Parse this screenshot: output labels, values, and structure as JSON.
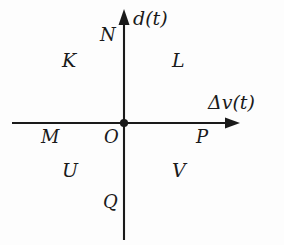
{
  "diagram": {
    "background_color": "#fdfdfd",
    "stroke_color": "#1a1a1a",
    "axes": {
      "vertical": {
        "name": "vertical-axis",
        "label": "d(t)",
        "arrow_direction": "up"
      },
      "horizontal": {
        "name": "horizontal-axis",
        "label": "Δv(t)",
        "arrow_direction": "right"
      }
    },
    "origin": {
      "label": "O",
      "marker": "filled-dot",
      "x": 124,
      "y": 123
    },
    "axis_points": [
      {
        "label": "N",
        "axis": "vertical",
        "side": "upper-left-of-axis"
      },
      {
        "label": "M",
        "axis": "horizontal",
        "side": "left-below-axis"
      },
      {
        "label": "P",
        "axis": "horizontal",
        "side": "right-below-axis"
      },
      {
        "label": "Q",
        "axis": "vertical",
        "side": "lower-left-of-axis"
      }
    ],
    "quadrants": [
      {
        "label": "K",
        "position": "upper-left"
      },
      {
        "label": "L",
        "position": "upper-right"
      },
      {
        "label": "U",
        "position": "lower-left"
      },
      {
        "label": "V",
        "position": "lower-right"
      }
    ]
  }
}
